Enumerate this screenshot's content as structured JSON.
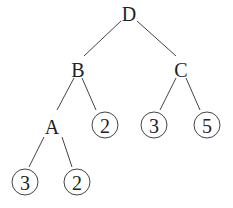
{
  "diagram": {
    "type": "tree",
    "nodes": [
      {
        "id": "D",
        "label": "D",
        "kind": "internal",
        "x": 129,
        "y": 13
      },
      {
        "id": "B",
        "label": "B",
        "kind": "internal",
        "x": 78,
        "y": 69
      },
      {
        "id": "C",
        "label": "C",
        "kind": "internal",
        "x": 181,
        "y": 69
      },
      {
        "id": "A",
        "label": "A",
        "kind": "internal",
        "x": 52,
        "y": 126
      },
      {
        "id": "B2",
        "label": "2",
        "kind": "leaf",
        "x": 105,
        "y": 125
      },
      {
        "id": "C3",
        "label": "3",
        "kind": "leaf",
        "x": 154,
        "y": 125
      },
      {
        "id": "C5",
        "label": "5",
        "kind": "leaf",
        "x": 207,
        "y": 125
      },
      {
        "id": "A3",
        "label": "3",
        "kind": "leaf",
        "x": 25,
        "y": 182
      },
      {
        "id": "A2",
        "label": "2",
        "kind": "leaf",
        "x": 77,
        "y": 182
      }
    ],
    "edges": [
      {
        "from": "D",
        "to": "B",
        "x1": 121,
        "y1": 21,
        "x2": 84,
        "y2": 56
      },
      {
        "from": "D",
        "to": "C",
        "x1": 137,
        "y1": 21,
        "x2": 176,
        "y2": 56
      },
      {
        "from": "B",
        "to": "A",
        "x1": 74,
        "y1": 78,
        "x2": 57,
        "y2": 110
      },
      {
        "from": "B",
        "to": "B2",
        "x1": 82,
        "y1": 78,
        "x2": 96,
        "y2": 110
      },
      {
        "from": "C",
        "to": "C3",
        "x1": 176,
        "y1": 78,
        "x2": 160,
        "y2": 110
      },
      {
        "from": "C",
        "to": "C5",
        "x1": 186,
        "y1": 78,
        "x2": 200,
        "y2": 110
      },
      {
        "from": "A",
        "to": "A3",
        "x1": 44,
        "y1": 137,
        "x2": 29,
        "y2": 167
      },
      {
        "from": "A",
        "to": "A2",
        "x1": 62,
        "y1": 137,
        "x2": 72,
        "y2": 167
      }
    ],
    "leaf_radius": 13
  }
}
